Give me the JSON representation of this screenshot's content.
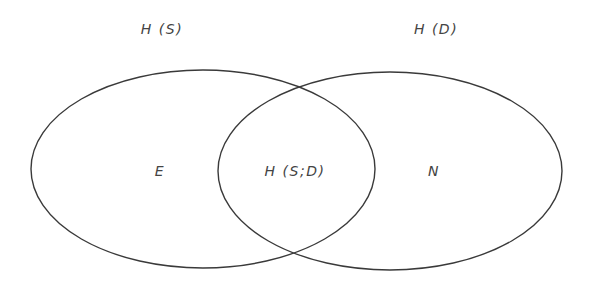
{
  "diagram": {
    "type": "venn",
    "stroke_color": "#3a3a3a",
    "text_color": "#444444",
    "background": "#ffffff",
    "sets": [
      {
        "id": "source",
        "title": "H (S)",
        "region_label": "E",
        "ellipse": {
          "cx": 203,
          "cy": 169,
          "rx": 172,
          "ry": 99
        }
      },
      {
        "id": "destination",
        "title": "H (D)",
        "region_label": "N",
        "ellipse": {
          "cx": 390,
          "cy": 171,
          "rx": 172,
          "ry": 99
        }
      }
    ],
    "intersection": {
      "label": "H (S;D)"
    }
  },
  "labels": {
    "set_left_title": "H (S)",
    "set_right_title": "H (D)",
    "left_only": "E",
    "overlap": "H (S;D)",
    "right_only": "N"
  }
}
